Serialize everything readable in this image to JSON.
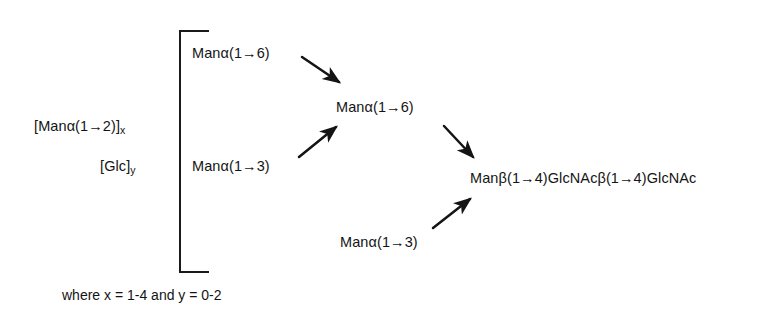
{
  "diagram": {
    "background_color": "#ffffff",
    "ink_color": "#141414",
    "nodes": {
      "left_repeat_man": "[Manα(1→2)]x",
      "left_repeat_man_base": "[Manα(1→2)]",
      "left_repeat_man_sub": "x",
      "left_repeat_glc_base": "[Glc]",
      "left_repeat_glc_sub": "y",
      "branch_upper": "Manα(1→6)",
      "branch_lower": "Manα(1→3)",
      "middle_man6": "Manα(1→6)",
      "bottom_man3": "Manα(1→3)",
      "core_chain": "Manβ(1→4)GlcNAcβ(1→4)GlcNAc"
    },
    "caption": "where x = 1-4 and y = 0-2",
    "arrows": [
      {
        "name": "arrow-upper-branch-to-man6",
        "direction": "down-right",
        "from_x": 302,
        "from_y": 57,
        "to_x": 339,
        "to_y": 82
      },
      {
        "name": "arrow-lower-branch-to-man6",
        "direction": "up-right",
        "from_x": 299,
        "from_y": 157,
        "to_x": 336,
        "to_y": 127
      },
      {
        "name": "arrow-man6-to-core",
        "direction": "down-right",
        "from_x": 444,
        "from_y": 126,
        "to_x": 473,
        "to_y": 157
      },
      {
        "name": "arrow-man3-to-core",
        "direction": "up-right",
        "from_x": 433,
        "from_y": 228,
        "to_x": 470,
        "to_y": 199
      }
    ],
    "bracket": {
      "name": "grouping-bracket",
      "left": 179,
      "top": 30,
      "width": 30,
      "height": 243
    }
  }
}
